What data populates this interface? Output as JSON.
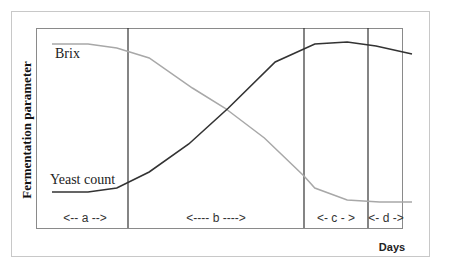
{
  "chart_data": {
    "type": "line",
    "title": "",
    "xlabel": "Days",
    "ylabel": "Fermentation parameter",
    "grid": false,
    "legend": "inline labels",
    "phases": [
      {
        "label": "<-- a -->",
        "name": "a"
      },
      {
        "label": "<---- b ---->",
        "name": "b"
      },
      {
        "label": "<- c - >",
        "name": "c"
      },
      {
        "label": "<- d ->",
        "name": "d"
      }
    ],
    "phase_boundaries_x": [
      0,
      0.25,
      0.73,
      0.9,
      1.0
    ],
    "series": [
      {
        "name": "Brix",
        "color": "#a8a8a8",
        "x": [
          0.0,
          0.1,
          0.18,
          0.27,
          0.39,
          0.48,
          0.59,
          0.7,
          0.73,
          0.82,
          0.91,
          1.0
        ],
        "y": [
          0.92,
          0.92,
          0.9,
          0.85,
          0.7,
          0.6,
          0.45,
          0.26,
          0.2,
          0.14,
          0.13,
          0.13
        ]
      },
      {
        "name": "Yeast count",
        "color": "#333333",
        "x": [
          0.0,
          0.1,
          0.18,
          0.27,
          0.38,
          0.49,
          0.62,
          0.73,
          0.82,
          0.9,
          1.0
        ],
        "y": [
          0.18,
          0.18,
          0.2,
          0.28,
          0.42,
          0.6,
          0.83,
          0.92,
          0.93,
          0.91,
          0.87
        ]
      }
    ]
  },
  "labels": {
    "ylabel": "Fermentation parameter",
    "xlabel": "Days",
    "brix": "Brix",
    "yeast": "Yeast count",
    "phase_a": "<-- a -->",
    "phase_b": "<---- b ---->",
    "phase_c": "<- c - >",
    "phase_d": "<- d ->"
  },
  "colors": {
    "brix": "#a8a8a8",
    "yeast": "#333333",
    "divider": "#333333",
    "frame": "#8a8a8a"
  }
}
